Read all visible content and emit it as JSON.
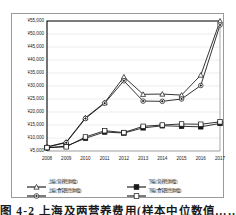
{
  "chart_data": {
    "type": "line",
    "title": "",
    "xlabel": "",
    "ylabel": "",
    "currency_symbol": "¥",
    "x": [
      "2008",
      "2009",
      "2010",
      "2011",
      "2012",
      "2013",
      "2014",
      "2015",
      "2016",
      "2017"
    ],
    "categories": [
      "2008",
      "2009",
      "2010",
      "2011",
      "2012",
      "2013",
      "2014",
      "2015",
      "2016",
      "2017"
    ],
    "ylim": [
      5000,
      55000
    ],
    "ytick_values": [
      5000,
      10000,
      15000,
      20000,
      25000,
      30000,
      35000,
      40000,
      45000,
      50000,
      55000
    ],
    "ytick_labels": [
      "¥5,000",
      "¥10,000",
      "¥15,000",
      "¥20,000",
      "¥25,000",
      "¥30,000",
      "¥35,000",
      "¥40,000",
      "¥45,000",
      "¥50,000",
      "¥55,000"
    ],
    "grid": true,
    "legend_position": "bottom",
    "series": [
      {
        "name": "上端(营养性肿瘤)",
        "marker": "triangle",
        "values": [
          6600,
          8400,
          17800,
          23600,
          33500,
          26800,
          26900,
          26500,
          34200,
          55000
        ]
      },
      {
        "name": "下端(营养性肿瘤)",
        "marker": "filled-square",
        "values": [
          6200,
          6900,
          9900,
          12300,
          11900,
          13900,
          14700,
          14500,
          14300,
          15600
        ]
      },
      {
        "name": "上端(食管恶性肿瘤)",
        "marker": "circle",
        "values": [
          6500,
          8200,
          17500,
          23400,
          32000,
          24200,
          24100,
          25000,
          30200,
          53500
        ]
      },
      {
        "name": "下端(食管恶性肿瘤)",
        "marker": "open-square",
        "values": [
          6300,
          6600,
          10400,
          12800,
          12100,
          14500,
          15000,
          15400,
          15300,
          16200
        ]
      }
    ]
  },
  "legend": {
    "rows": [
      [
        {
          "marker": "triangle",
          "label": "上端(营养性肿瘤)"
        },
        {
          "marker": "filled-square",
          "label": "下端(营养性肿瘤)"
        }
      ],
      [
        {
          "marker": "circle",
          "label": "上端(食管恶性肿瘤)"
        },
        {
          "marker": "open-square",
          "label": "下端(食管恶性肿瘤)"
        }
      ]
    ]
  },
  "caption": {
    "text": "图 4-2  上海及两营养费用(样本中位数值……  图 4"
  }
}
